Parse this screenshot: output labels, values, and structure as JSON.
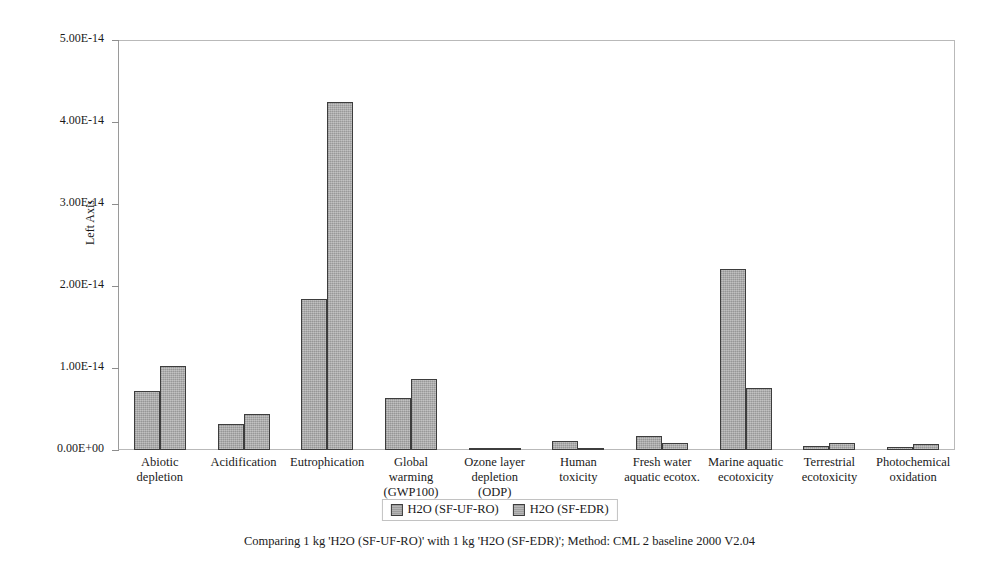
{
  "chart_data": {
    "type": "bar",
    "title": "",
    "subtitle": "",
    "xlabel": "",
    "ylabel": "Left Axis",
    "ylim": [
      0,
      5e-14
    ],
    "grid": false,
    "legend_position": "bottom",
    "ytick_labels": [
      "0.00E+00",
      "1.00E-14",
      "2.00E-14",
      "3.00E-14",
      "4.00E-14",
      "5.00E-14"
    ],
    "ytick_values": [
      0,
      1e-14,
      2e-14,
      3e-14,
      4e-14,
      5e-14
    ],
    "categories": [
      "Abiotic depletion",
      "Acidification",
      "Eutrophication",
      "Global warming (GWP100)",
      "Ozone layer depletion (ODP)",
      "Human toxicity",
      "Fresh water aquatic ecotox.",
      "Marine aquatic ecotoxicity",
      "Terrestrial ecotoxicity",
      "Photochemical oxidation"
    ],
    "category_lines": [
      [
        "Abiotic",
        "depletion"
      ],
      [
        "Acidification"
      ],
      [
        "Eutrophication"
      ],
      [
        "Global",
        "warming",
        "(GWP100)"
      ],
      [
        "Ozone layer",
        "depletion",
        "(ODP)"
      ],
      [
        "Human",
        "toxicity"
      ],
      [
        "Fresh water",
        "aquatic ecotox."
      ],
      [
        "Marine aquatic",
        "ecotoxicity"
      ],
      [
        "Terrestrial",
        "ecotoxicity"
      ],
      [
        "Photochemical",
        "oxidation"
      ]
    ],
    "series": [
      {
        "name": "H2O (SF-UF-RO)",
        "color": "#a6a6a6",
        "values": [
          7.2e-15,
          3.2e-15,
          1.84e-14,
          6.3e-15,
          2e-17,
          1.1e-15,
          1.7e-15,
          2.21e-14,
          5e-16,
          4e-16
        ]
      },
      {
        "name": "H2O (SF-EDR)",
        "color": "#a9a9a9",
        "values": [
          1.02e-14,
          4.4e-15,
          4.24e-14,
          8.6e-15,
          1e-17,
          2e-16,
          8e-16,
          7.6e-15,
          9e-16,
          7e-16
        ]
      }
    ]
  },
  "legend": {
    "items": [
      {
        "label": "H2O (SF-UF-RO)"
      },
      {
        "label": "H2O (SF-EDR)"
      }
    ]
  },
  "caption": {
    "text": "Comparing 1 kg 'H2O (SF-UF-RO)' with 1 kg 'H2O (SF-EDR)';  Method: CML 2 baseline 2000 V2.04"
  }
}
